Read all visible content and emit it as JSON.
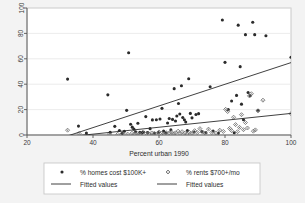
{
  "chart_data": {
    "type": "scatter",
    "title": "",
    "subtitle": "",
    "xlabel": "Percent urban 1990",
    "ylabel": "",
    "xlim": [
      20,
      100
    ],
    "ylim": [
      0,
      100
    ],
    "xticks": [
      "20",
      "40",
      "60",
      "80",
      "100"
    ],
    "yticks": [
      "0",
      "20",
      "40",
      "60",
      "80",
      "100"
    ],
    "xtick_values": [
      20,
      40,
      60,
      80,
      100
    ],
    "ytick_values": [
      0,
      20,
      40,
      60,
      80,
      100
    ],
    "grid": "horizontal",
    "legend_position": "bottom",
    "series": [
      {
        "name": "% homes cost $100K+",
        "marker": "filled-circle",
        "color": "#2b2b2b",
        "points": [
          [
            32.3,
            44.0
          ],
          [
            35.6,
            7.0
          ],
          [
            38.0,
            1.5
          ],
          [
            44.5,
            31.6
          ],
          [
            45.2,
            2.2
          ],
          [
            46.6,
            6.8
          ],
          [
            48.0,
            3.5
          ],
          [
            48.8,
            1.3
          ],
          [
            49.5,
            3.0
          ],
          [
            50.2,
            19.4
          ],
          [
            50.8,
            64.8
          ],
          [
            51.4,
            8.5
          ],
          [
            51.9,
            6.2
          ],
          [
            52.4,
            4.6
          ],
          [
            52.9,
            2.6
          ],
          [
            53.6,
            9.2
          ],
          [
            54.2,
            2.1
          ],
          [
            54.8,
            1.7
          ],
          [
            55.3,
            2.3
          ],
          [
            56.0,
            14.5
          ],
          [
            56.6,
            1.9
          ],
          [
            57.3,
            5.0
          ],
          [
            58.0,
            11.9
          ],
          [
            58.6,
            1.6
          ],
          [
            59.2,
            12.0
          ],
          [
            59.8,
            2.0
          ],
          [
            60.3,
            12.6
          ],
          [
            60.9,
            21.0
          ],
          [
            61.4,
            3.1
          ],
          [
            62.0,
            1.8
          ],
          [
            62.6,
            9.4
          ],
          [
            63.1,
            13.0
          ],
          [
            63.6,
            4.0
          ],
          [
            64.1,
            12.3
          ],
          [
            64.6,
            36.5
          ],
          [
            65.0,
            11.0
          ],
          [
            65.4,
            15.0
          ],
          [
            65.9,
            24.8
          ],
          [
            66.3,
            16.5
          ],
          [
            66.8,
            38.8
          ],
          [
            67.2,
            13.8
          ],
          [
            67.7,
            12.0
          ],
          [
            68.1,
            10.2
          ],
          [
            68.6,
            3.5
          ],
          [
            69.0,
            44.3
          ],
          [
            69.5,
            17.0
          ],
          [
            70.0,
            13.5
          ],
          [
            70.6,
            2.4
          ],
          [
            71.2,
            16.2
          ],
          [
            72.0,
            16.8
          ],
          [
            73.0,
            2.7
          ],
          [
            74.2,
            2.0
          ],
          [
            75.5,
            38.0
          ],
          [
            76.4,
            3.2
          ],
          [
            78.0,
            1.5
          ],
          [
            79.2,
            90.5
          ],
          [
            80.0,
            57.2
          ],
          [
            81.0,
            20.0
          ],
          [
            82.0,
            26.8
          ],
          [
            82.8,
            1.8
          ],
          [
            83.5,
            31.2
          ],
          [
            84.0,
            86.5
          ],
          [
            84.6,
            53.8
          ],
          [
            85.0,
            24.3
          ],
          [
            85.6,
            12.0
          ],
          [
            86.2,
            79.0
          ],
          [
            87.0,
            33.5
          ],
          [
            87.6,
            31.0
          ],
          [
            88.4,
            88.8
          ],
          [
            89.0,
            79.0
          ],
          [
            90.0,
            19.5
          ],
          [
            92.4,
            78.2
          ],
          [
            100.0,
            61.2
          ]
        ]
      },
      {
        "name": "% rents $700+/mo",
        "marker": "diamond",
        "color": "#6b6b6b",
        "points": [
          [
            32.3,
            3.8
          ],
          [
            35.8,
            1.2
          ],
          [
            45.0,
            0.8
          ],
          [
            47.5,
            0.6
          ],
          [
            49.0,
            1.0
          ],
          [
            50.5,
            0.7
          ],
          [
            51.8,
            1.4
          ],
          [
            52.6,
            0.9
          ],
          [
            53.4,
            1.1
          ],
          [
            54.0,
            0.5
          ],
          [
            55.0,
            2.0
          ],
          [
            56.2,
            1.3
          ],
          [
            57.0,
            0.8
          ],
          [
            57.8,
            1.6
          ],
          [
            58.5,
            1.0
          ],
          [
            59.4,
            0.6
          ],
          [
            60.0,
            2.4
          ],
          [
            60.8,
            1.2
          ],
          [
            61.5,
            0.9
          ],
          [
            62.2,
            1.8
          ],
          [
            63.0,
            1.4
          ],
          [
            63.8,
            2.2
          ],
          [
            64.4,
            0.8
          ],
          [
            65.0,
            1.7
          ],
          [
            65.8,
            3.0
          ],
          [
            66.4,
            1.1
          ],
          [
            67.0,
            2.6
          ],
          [
            67.8,
            1.5
          ],
          [
            68.5,
            0.9
          ],
          [
            69.2,
            2.1
          ],
          [
            70.0,
            1.3
          ],
          [
            70.8,
            3.4
          ],
          [
            71.6,
            1.9
          ],
          [
            72.4,
            5.0
          ],
          [
            73.2,
            2.3
          ],
          [
            74.0,
            1.4
          ],
          [
            75.0,
            4.6
          ],
          [
            76.0,
            2.0
          ],
          [
            77.2,
            1.6
          ],
          [
            78.4,
            3.8
          ],
          [
            79.5,
            2.8
          ],
          [
            80.2,
            20.2
          ],
          [
            80.8,
            18.5
          ],
          [
            81.4,
            5.2
          ],
          [
            82.0,
            3.4
          ],
          [
            82.6,
            14.0
          ],
          [
            83.2,
            8.2
          ],
          [
            83.8,
            2.6
          ],
          [
            84.4,
            6.0
          ],
          [
            85.0,
            16.0
          ],
          [
            85.6,
            4.2
          ],
          [
            86.2,
            9.8
          ],
          [
            86.8,
            5.5
          ],
          [
            87.4,
            30.8
          ],
          [
            88.0,
            32.5
          ],
          [
            88.6,
            3.0
          ],
          [
            89.2,
            4.0
          ],
          [
            90.0,
            19.0
          ],
          [
            91.5,
            27.4
          ],
          [
            100.0,
            16.8
          ]
        ]
      }
    ],
    "fitted_lines": [
      {
        "name": "Fitted values",
        "for_series": "% homes cost $100K+",
        "color": "#2b2b2b",
        "x": [
          32.0,
          100.0
        ],
        "y": [
          -1.0,
          57.0
        ]
      },
      {
        "name": "Fitted values",
        "for_series": "% rents $700+/mo",
        "color": "#2b2b2b",
        "x": [
          32.0,
          100.0
        ],
        "y": [
          -1.5,
          17.0
        ]
      }
    ]
  },
  "legend": {
    "entries": [
      {
        "label": "% homes cost $100K+",
        "marker": "filled-circle"
      },
      {
        "label": "% rents $700+/mo",
        "marker": "diamond"
      },
      {
        "label": "Fitted values",
        "marker": "line"
      },
      {
        "label": "Fitted values",
        "marker": "line"
      }
    ]
  },
  "axes": {
    "x_title": "Percent urban 1990",
    "x_tick_labels": [
      "20",
      "40",
      "60",
      "80",
      "100"
    ],
    "y_tick_labels": [
      "0",
      "20",
      "40",
      "60",
      "80",
      "100"
    ]
  },
  "colors": {
    "figure_background": "#f3f3f3",
    "plot_background": "#ffffff",
    "marker_primary": "#2b2b2b",
    "marker_secondary": "#6b6b6b",
    "line": "#2b2b2b",
    "grid": "#e4e4e4",
    "frame": "#c9c9c9",
    "axis": "#555555"
  }
}
